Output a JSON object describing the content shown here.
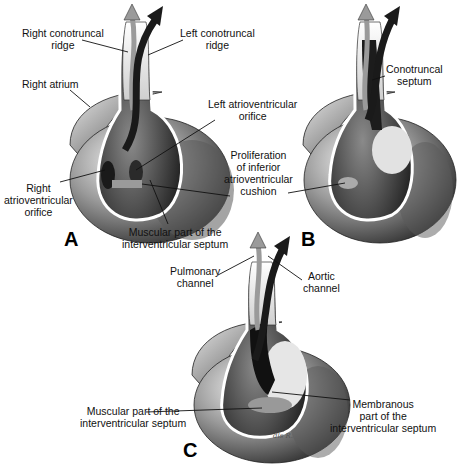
{
  "figure": {
    "panels": [
      {
        "letter": "A",
        "labels": {
          "right_conotruncal_ridge": [
            "Right conotruncal",
            "ridge"
          ],
          "left_conotruncal_ridge": [
            "Left conotruncal",
            "ridge"
          ],
          "right_atrium": [
            "Right atrium"
          ],
          "left_av_orifice": [
            "Left atrioventricular",
            "orifice"
          ],
          "right_av_orifice": [
            "Right",
            "atrioventricular",
            "orifice"
          ],
          "muscular_septum": [
            "Muscular part of the",
            "interventricular septum"
          ]
        }
      },
      {
        "letter": "B",
        "labels": {
          "conotruncal_septum": [
            "Conotruncal",
            "septum"
          ],
          "inferior_cushion": [
            "Proliferation",
            "of inferior",
            "atrioventricular",
            "cushion"
          ]
        }
      },
      {
        "letter": "C",
        "labels": {
          "pulmonary_channel": [
            "Pulmonary",
            "channel"
          ],
          "aortic_channel": [
            "Aortic",
            "channel"
          ],
          "muscular_septum": [
            "Muscular part of the",
            "interventricular septum"
          ],
          "membranous_septum": [
            "Membranous",
            "part of the",
            "interventricular septum"
          ]
        },
        "signature": "dls R."
      }
    ],
    "colors": {
      "ink": "#111111",
      "dark_shade": "#1e1e1e",
      "mid_shade": "#7a7a7a",
      "light_shade": "#d6d6d6",
      "pulmonary_arrow": "#9a9a9a",
      "aortic_arrow": "#1a1a1a"
    }
  }
}
